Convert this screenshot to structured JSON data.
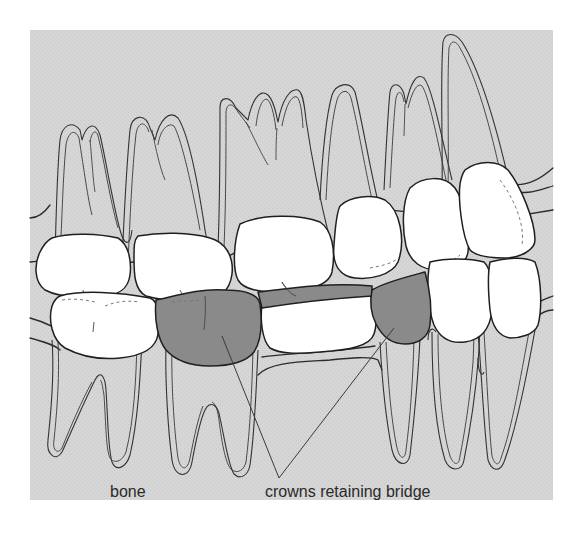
{
  "figure": {
    "colors": {
      "page_background": "#ffffff",
      "bone_panel": "#d4d4d4",
      "tooth_crown": "#ffffff",
      "bridge_crown": "#8a8a8a",
      "outline": "#1f1f1f",
      "label_text": "#2a2a2a"
    }
  },
  "labels": {
    "bone": "bone",
    "crowns": "crowns retaining bridge"
  },
  "parts": {
    "upper_jaw": {
      "name": "upper teeth",
      "tooth_count": 6
    },
    "lower_jaw": {
      "name": "lower teeth",
      "tooth_count": 6
    },
    "bridge": {
      "name": "bridge",
      "abutment_crowns": 2,
      "pontics": 1
    }
  }
}
